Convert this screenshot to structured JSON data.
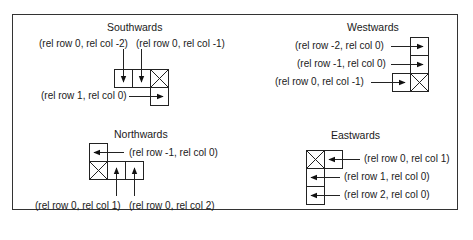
{
  "diagram": {
    "panels": {
      "south": {
        "title": "Southwards",
        "labels": [
          "(rel row 0, rel col -2)",
          "(rel row 0, rel col -1)",
          "(rel row 1, rel col 0)"
        ]
      },
      "west": {
        "title": "Westwards",
        "labels": [
          "(rel row -2, rel col 0)",
          "(rel row -1, rel col 0)",
          "(rel row 0, rel col -1)"
        ]
      },
      "north": {
        "title": "Northwards",
        "labels": [
          "(rel row -1, rel col 0)",
          "(rel row 0, rel col 1)",
          "(rel row 0, rel col 2)"
        ]
      },
      "east": {
        "title": "Eastwards",
        "labels": [
          "(rel row 0, rel col 1)",
          "(rel row 1, rel col 0)",
          "(rel row 2, rel col 0)"
        ]
      }
    },
    "colors": {
      "line": "#222222",
      "frame": "#333333",
      "background": "#ffffff"
    }
  }
}
